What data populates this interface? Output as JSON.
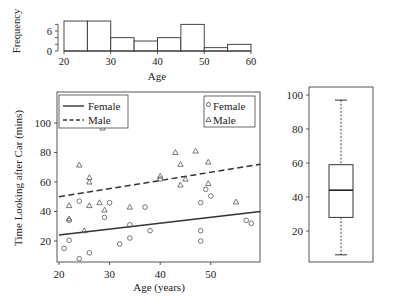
{
  "chart_data": [
    {
      "id": "age-histogram",
      "type": "bar",
      "title": "",
      "xlabel": "Age",
      "ylabel": "Frequency",
      "bin_edges": [
        20,
        25,
        30,
        35,
        40,
        45,
        50,
        55,
        60
      ],
      "categories": [
        "20-25",
        "25-30",
        "30-35",
        "35-40",
        "40-45",
        "45-50",
        "50-55",
        "55-60"
      ],
      "values": [
        9,
        9,
        4,
        3,
        4,
        8,
        1,
        2
      ],
      "xlim": [
        20,
        60
      ],
      "ylim": [
        0,
        9
      ],
      "x_ticks": [
        "20",
        "30",
        "40",
        "50",
        "60"
      ],
      "y_ticks": [
        "0",
        "6"
      ],
      "grid": false
    },
    {
      "id": "scatter-time-vs-age",
      "type": "scatter",
      "title": "",
      "xlabel": "Age (years)",
      "ylabel": "Time Looking after Car (mins)",
      "xlim": [
        20,
        60
      ],
      "ylim": [
        5,
        115
      ],
      "x_ticks": [
        "20",
        "30",
        "40",
        "50"
      ],
      "y_ticks": [
        "20",
        "40",
        "60",
        "80",
        "100"
      ],
      "grid": false,
      "series": [
        {
          "name": "Female",
          "marker": "circle",
          "points": [
            [
              21,
              15
            ],
            [
              22,
              20.5
            ],
            [
              22,
              34
            ],
            [
              24,
              8
            ],
            [
              24,
              47
            ],
            [
              26,
              12
            ],
            [
              29,
              36
            ],
            [
              30,
              46
            ],
            [
              32,
              18
            ],
            [
              34,
              31
            ],
            [
              34,
              22
            ],
            [
              37,
              43
            ],
            [
              38,
              27
            ],
            [
              40,
              62
            ],
            [
              48,
              46
            ],
            [
              48,
              27
            ],
            [
              48,
              20
            ],
            [
              49,
              55
            ],
            [
              50,
              50.5
            ],
            [
              57,
              34
            ],
            [
              58,
              32
            ]
          ]
        },
        {
          "name": "Male",
          "marker": "triangle",
          "points": [
            [
              22,
              44
            ],
            [
              22,
              35
            ],
            [
              24,
              71.5
            ],
            [
              25,
              27
            ],
            [
              26,
              63
            ],
            [
              26,
              60
            ],
            [
              26,
              44
            ],
            [
              28,
              46
            ],
            [
              28.6,
              96.6
            ],
            [
              29,
              41
            ],
            [
              34,
              43
            ],
            [
              40,
              64
            ],
            [
              43,
              80
            ],
            [
              44,
              72
            ],
            [
              44,
              58
            ],
            [
              45,
              62
            ],
            [
              47,
              81
            ],
            [
              49.5,
              73.5
            ],
            [
              49.5,
              59
            ],
            [
              55,
              46.5
            ]
          ]
        }
      ],
      "fit_lines": [
        {
          "name": "Female",
          "style": "solid",
          "x": [
            20,
            60
          ],
          "y": [
            24,
            40
          ]
        },
        {
          "name": "Male",
          "style": "dashed",
          "x": [
            20,
            60
          ],
          "y": [
            50,
            72
          ]
        }
      ],
      "legends": [
        {
          "position": "top-left",
          "entries": [
            {
              "label": "Female",
              "style": "solid"
            },
            {
              "label": "Male",
              "style": "dashed"
            }
          ]
        },
        {
          "position": "top-right",
          "entries": [
            {
              "label": "Female",
              "marker": "circle"
            },
            {
              "label": "Male",
              "marker": "triangle"
            }
          ]
        }
      ]
    },
    {
      "id": "time-boxplot",
      "type": "box",
      "title": "",
      "ylim": [
        5,
        100
      ],
      "y_ticks": [
        "20",
        "40",
        "60",
        "80",
        "100"
      ],
      "min": 6,
      "q1": 28,
      "median": 44,
      "q3": 59,
      "max": 97,
      "grid": false
    }
  ],
  "labels": {
    "hist_ylabel": "Frequency",
    "hist_xlabel": "Age",
    "scatter_ylabel": "Time Looking after Car (mins)",
    "scatter_xlabel": "Age (years)",
    "line_legend_female": "Female",
    "line_legend_male": "Male",
    "marker_legend_female": "Female",
    "marker_legend_male": "Male"
  }
}
